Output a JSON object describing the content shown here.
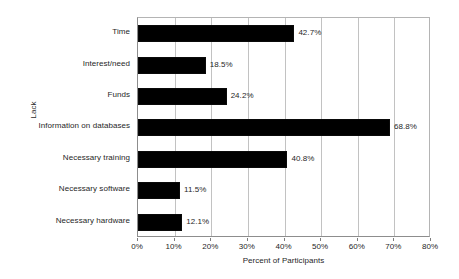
{
  "chart_data": {
    "type": "bar",
    "orientation": "horizontal",
    "title": "",
    "xlabel": "Percent of Participants",
    "ylabel": "Lack",
    "xlim": [
      0,
      80
    ],
    "xtick_labels": [
      "0%",
      "10%",
      "20%",
      "30%",
      "40%",
      "50%",
      "60%",
      "70%",
      "80%"
    ],
    "xtick_values": [
      0,
      10,
      20,
      30,
      40,
      50,
      60,
      70,
      80
    ],
    "grid": true,
    "legend": false,
    "bar_color": "#000000",
    "categories": [
      "Time",
      "Interest/need",
      "Funds",
      "Information on databases",
      "Necessary training",
      "Necessary software",
      "Necessary hardware"
    ],
    "values": [
      42.7,
      18.5,
      24.2,
      68.8,
      40.8,
      11.5,
      12.1
    ],
    "value_labels": [
      "42.7%",
      "18.5%",
      "24.2%",
      "68.8%",
      "40.8%",
      "11.5%",
      "12.1%"
    ]
  }
}
